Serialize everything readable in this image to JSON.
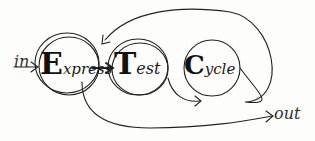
{
  "diagram": {
    "title": "Express Test Cycle",
    "nodes": [
      {
        "id": "express",
        "initial": "E",
        "rest": "xpress",
        "label": "Express"
      },
      {
        "id": "test",
        "initial": "T",
        "rest": "est",
        "label": "Test"
      },
      {
        "id": "cycle",
        "initial": "C",
        "rest": "ycle",
        "label": "Cycle"
      }
    ],
    "input_label": "in",
    "output_label": "out",
    "edges": [
      {
        "from": "in",
        "to": "express"
      },
      {
        "from": "express",
        "to": "test"
      },
      {
        "from": "test",
        "to": "cycle"
      },
      {
        "from": "cycle",
        "to": "express",
        "note": "feedback loop over top"
      },
      {
        "from": "express",
        "to": "out"
      }
    ],
    "colors": {
      "ink": "#1a1a1a",
      "paper": "#fdfdfc"
    }
  }
}
